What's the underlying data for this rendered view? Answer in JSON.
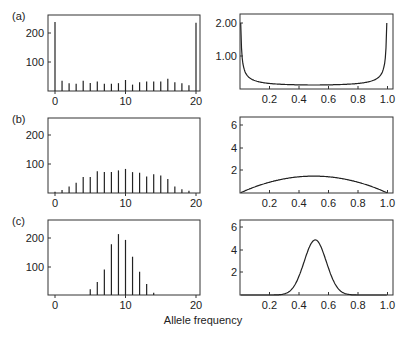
{
  "chart_data": [
    {
      "panel": "(a)",
      "type": "bar",
      "title": "",
      "x": [
        0,
        1,
        2,
        3,
        4,
        5,
        6,
        7,
        8,
        9,
        10,
        11,
        12,
        13,
        14,
        15,
        16,
        17,
        18,
        19,
        20
      ],
      "values": [
        238,
        35,
        27,
        25,
        35,
        28,
        33,
        25,
        25,
        27,
        38,
        22,
        30,
        33,
        33,
        33,
        42,
        30,
        27,
        20,
        235
      ],
      "xticks": [
        "0",
        "10",
        "20"
      ],
      "yticks": [
        "100",
        "200"
      ],
      "xlim": [
        0,
        20
      ],
      "ylim": [
        0,
        260
      ]
    },
    {
      "panel": "(a)",
      "type": "line",
      "description": "U-shaped density, high near 0 and 1, ~0.05 in middle",
      "xticks": [
        "0.2",
        "0.4",
        "0.6",
        "0.8",
        "1.0"
      ],
      "yticks": [
        "1.00",
        "2.00"
      ],
      "xlim": [
        0,
        1
      ],
      "ylim": [
        0,
        2.25
      ]
    },
    {
      "panel": "(b)",
      "type": "bar",
      "x": [
        0,
        1,
        2,
        3,
        4,
        5,
        6,
        7,
        8,
        9,
        10,
        11,
        12,
        13,
        14,
        15,
        16,
        17,
        18,
        19
      ],
      "values": [
        4,
        10,
        22,
        35,
        55,
        55,
        75,
        72,
        72,
        78,
        83,
        72,
        70,
        57,
        65,
        60,
        48,
        22,
        13,
        8
      ],
      "xticks": [
        "0",
        "10",
        "20"
      ],
      "yticks": [
        "100",
        "200"
      ],
      "xlim": [
        0,
        20
      ],
      "ylim": [
        0,
        260
      ]
    },
    {
      "panel": "(b)",
      "type": "line",
      "description": "Parabola 6x(1-x), peak 1.5 at 0.5",
      "xticks": [
        "0.2",
        "0.4",
        "0.6",
        "0.8",
        "1.0"
      ],
      "yticks": [
        "2",
        "4",
        "6"
      ],
      "xlim": [
        0,
        1
      ],
      "ylim": [
        0,
        6.6
      ]
    },
    {
      "panel": "(c)",
      "type": "bar",
      "x": [
        5,
        6,
        7,
        8,
        9,
        10,
        11,
        12,
        13,
        14
      ],
      "values": [
        20,
        45,
        88,
        175,
        210,
        190,
        132,
        80,
        38,
        8
      ],
      "xticks": [
        "0",
        "10",
        "20"
      ],
      "yticks": [
        "100",
        "200"
      ],
      "xlim": [
        0,
        20
      ],
      "ylim": [
        0,
        260
      ]
    },
    {
      "panel": "(c)",
      "type": "line",
      "description": "Bell-shaped density centered ~0.51, peak ~4.9",
      "xticks": [
        "0.2",
        "0.4",
        "0.6",
        "0.8",
        "1.0"
      ],
      "yticks": [
        "2",
        "4",
        "6"
      ],
      "xlim": [
        0,
        1
      ],
      "ylim": [
        0,
        6.6
      ]
    }
  ],
  "labels": {
    "panel_a": "(a)",
    "panel_b": "(b)",
    "panel_c": "(c)",
    "xlabel": "Allele frequency"
  }
}
